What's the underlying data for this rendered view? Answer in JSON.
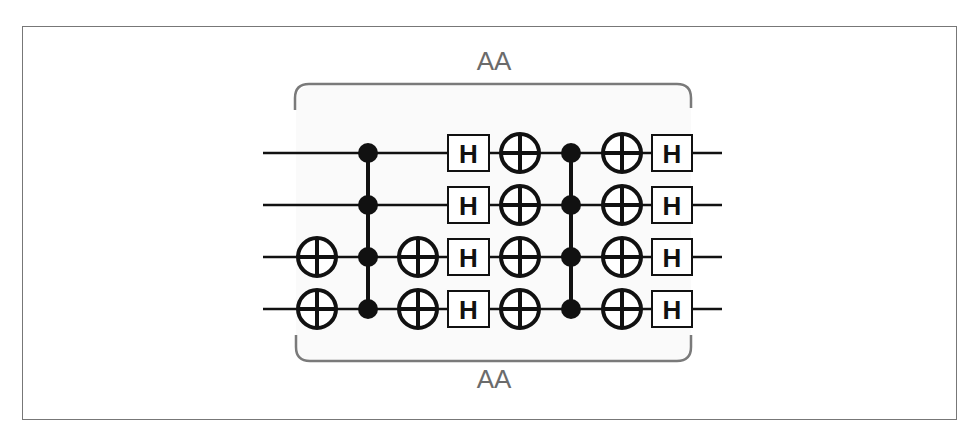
{
  "diagram": {
    "type": "quantum-circuit",
    "top_label": "AA",
    "bottom_label": "AA",
    "gate_label": "H",
    "colors": {
      "wire": "#111111",
      "bracket": "#7a7a7a",
      "label": "#6b6b6b",
      "border": "#777777"
    },
    "qubits": 4,
    "wires_y": [
      153,
      205,
      257,
      309
    ],
    "wire_x_start": 263,
    "wire_x_end": 722,
    "columns": [
      {
        "x": 317,
        "kind": "cnot-targets",
        "qubits": [
          2,
          3
        ]
      },
      {
        "x": 368,
        "kind": "multi-control",
        "qubits": [
          0,
          1,
          2,
          3
        ]
      },
      {
        "x": 418,
        "kind": "cnot-targets",
        "qubits": [
          2,
          3
        ]
      },
      {
        "x": 469,
        "kind": "hadamard",
        "qubits": [
          0,
          1,
          2,
          3
        ]
      },
      {
        "x": 520,
        "kind": "cnot-targets",
        "qubits": [
          0,
          1,
          2,
          3
        ]
      },
      {
        "x": 571,
        "kind": "multi-control",
        "qubits": [
          0,
          1,
          2,
          3
        ]
      },
      {
        "x": 622,
        "kind": "cnot-targets",
        "qubits": [
          0,
          1,
          2,
          3
        ]
      },
      {
        "x": 672,
        "kind": "hadamard",
        "qubits": [
          0,
          1,
          2,
          3
        ]
      }
    ],
    "bracket": {
      "x_left": 295,
      "x_right": 691,
      "top_y": 84,
      "bottom_y": 361
    }
  }
}
